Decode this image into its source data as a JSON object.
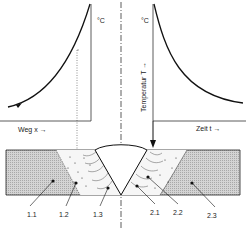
{
  "diagram": {
    "left_chart": {
      "unit_label": "°C",
      "x_axis_label": "Weg  x  →"
    },
    "right_chart": {
      "unit_label": "°C",
      "y_axis_label": "Temperatur  T  →",
      "x_axis_label": "Zeit  t  →"
    },
    "zones": {
      "left": [
        "1.1",
        "1.2",
        "1.3"
      ],
      "right": [
        "2.1",
        "2.2",
        "2.3"
      ]
    },
    "colors": {
      "line": "#1a1a1a",
      "hatch": "#b8b8b8",
      "background": "#ffffff"
    }
  }
}
